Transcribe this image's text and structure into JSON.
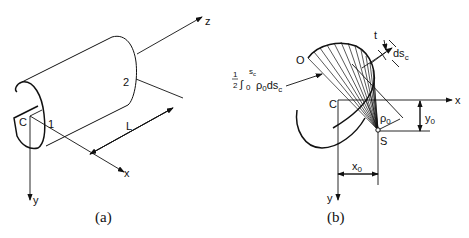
{
  "figure_a": {
    "caption": "(a)",
    "labels": {
      "z_axis": "z",
      "x_axis": "x",
      "y_axis": "y",
      "centroid": "C",
      "point1": "1",
      "point2": "2",
      "length": "L"
    }
  },
  "figure_b": {
    "caption": "(b)",
    "labels": {
      "origin": "O",
      "thickness": "t",
      "ds": "ds",
      "ds_sub": "c",
      "integral_frac_num": "1",
      "integral_frac_den": "2",
      "integral_upper": "s",
      "integral_upper_sub": "c",
      "integral_lower": "0",
      "integrand": "ρ",
      "integrand_sub": "0",
      "integrand_ds": "ds",
      "integrand_ds_sub": "c",
      "centroid": "C",
      "x_axis": "x",
      "y_axis": "y",
      "shear_center": "S",
      "rho": "ρ",
      "rho_sub": "0",
      "x0": "x",
      "x0_sub": "0",
      "y0": "y",
      "y0_sub": "0"
    }
  },
  "colors": {
    "line": "#111111",
    "background": "#ffffff"
  }
}
